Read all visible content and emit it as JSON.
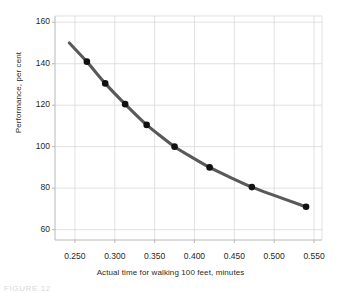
{
  "chart_data": {
    "type": "line",
    "title": "",
    "xlabel": "Actual time for walking  100 feet, minutes",
    "ylabel": "Performance, per cent",
    "xlim": [
      0.225,
      0.56
    ],
    "ylim": [
      55,
      163
    ],
    "xticks": [
      "0.250",
      "0.300",
      "0.350",
      "0.400",
      "0.450",
      "0.500",
      "0.550"
    ],
    "xtick_values": [
      0.25,
      0.3,
      0.35,
      0.4,
      0.45,
      0.5,
      0.55
    ],
    "yticks": [
      "160",
      "140",
      "120",
      "100",
      "80",
      "60"
    ],
    "ytick_values": [
      160,
      140,
      120,
      100,
      80,
      60
    ],
    "grid": true,
    "legend": null,
    "series": [
      {
        "name": "Performance vs walking time",
        "x": [
          0.265,
          0.288,
          0.313,
          0.34,
          0.375,
          0.419,
          0.472,
          0.54
        ],
        "values": [
          141,
          130.5,
          120.5,
          110.5,
          100,
          90,
          80.5,
          71
        ],
        "line_color": "#58595b",
        "marker_color": "#111111",
        "marker": "circle"
      }
    ],
    "curve_extent": {
      "x_start": 0.243,
      "y_start": 150,
      "x_end": 0.54,
      "y_end": 71
    }
  },
  "figure": {
    "caption_fragment": "FIGURE  12"
  },
  "colors": {
    "line": "#58595b",
    "marker": "#111111",
    "grid": "#d9d9d9",
    "axis": "#b8b8b8",
    "background": "#ffffff"
  }
}
